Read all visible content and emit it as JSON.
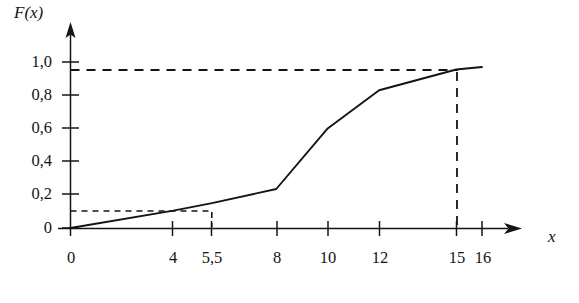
{
  "chart_data": {
    "type": "line",
    "title": "",
    "subtitle": "",
    "xlabel": "x",
    "ylabel": "F(x)",
    "xlim": [
      0,
      17
    ],
    "ylim": [
      0,
      1.03
    ],
    "grid": false,
    "legend": null,
    "decimal_separator": ",",
    "x_ticks": [
      {
        "value": 4,
        "label": "4"
      },
      {
        "value": 5.5,
        "label": "5,5"
      },
      {
        "value": 8,
        "label": "8"
      },
      {
        "value": 10,
        "label": "10"
      },
      {
        "value": 12,
        "label": "12"
      },
      {
        "value": 15,
        "label": "15"
      },
      {
        "value": 16,
        "label": "16"
      }
    ],
    "y_ticks": [
      {
        "value": 0.2,
        "label": "0,2"
      },
      {
        "value": 0.4,
        "label": "0,4"
      },
      {
        "value": 0.6,
        "label": "0,6"
      },
      {
        "value": 0.8,
        "label": "0,8"
      },
      {
        "value": 1.0,
        "label": "1,0"
      }
    ],
    "origin_label": "0",
    "series": [
      {
        "name": "F(x)",
        "x": [
          0,
          4,
          5.5,
          8,
          10,
          12,
          15,
          16
        ],
        "values": [
          0,
          0.105,
          0.15,
          0.235,
          0.6,
          0.83,
          0.955,
          0.97
        ]
      }
    ],
    "annotations": [
      {
        "name": "guide-lower",
        "type": "dashed-construction",
        "from": {
          "x": 0,
          "y": 0.15
        },
        "to": {
          "x": 5.5,
          "y": 0.15
        },
        "drop_to_axis": true,
        "y_value": 0.15,
        "x_value": 5.5
      },
      {
        "name": "guide-upper",
        "type": "dashed-construction",
        "from": {
          "x": 0,
          "y": 0.955
        },
        "to": {
          "x": 15,
          "y": 0.955
        },
        "drop_to_axis": true,
        "y_value": 0.955,
        "x_value": 15
      }
    ],
    "colors": {
      "ink": "#141414",
      "background": "#ffffff"
    }
  }
}
